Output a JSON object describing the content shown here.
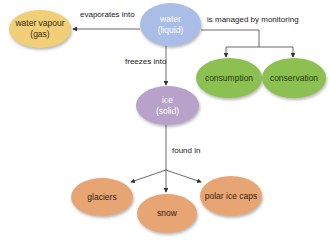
{
  "colors": {
    "gas": "#f1cf78",
    "liquid": "#a9bde6",
    "solid": "#b9a2c9",
    "management": "#8cc152",
    "location": "#e8a574",
    "line": "#444444",
    "text_dark": "#3a2a10"
  },
  "nodes": {
    "water": {
      "line1": "water",
      "line2": "(liquid)"
    },
    "vapour": {
      "line1": "water vapour",
      "line2": "(gas)"
    },
    "ice": {
      "line1": "ice",
      "line2": "(solid)"
    },
    "consumption": {
      "label": "consumption"
    },
    "conservation": {
      "label": "conservation"
    },
    "glaciers": {
      "label": "glaciers"
    },
    "snow": {
      "label": "snow"
    },
    "polar": {
      "label": "polar ice caps"
    }
  },
  "edges": {
    "evaporates": "evaporates into",
    "managed": "is managed by monitoring",
    "freezes": "freezes into",
    "found": "found in"
  }
}
